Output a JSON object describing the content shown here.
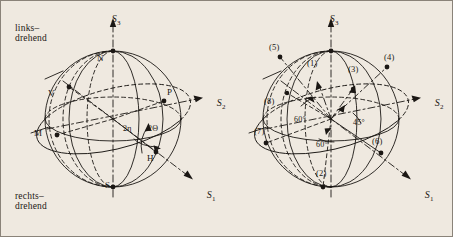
{
  "figure": {
    "kind": "poincare-sphere-pair",
    "background_color": "#efe9e0",
    "ink_color": "#1b1714",
    "border_color": "#8a8379"
  },
  "annotations": {
    "links_drehend": "links–\ndrehend",
    "rechts_drehend": "rechts–\ndrehend"
  },
  "left_sphere": {
    "axes": [
      {
        "name": "S3",
        "base": "S",
        "sub": "3"
      },
      {
        "name": "S2",
        "base": "S",
        "sub": "2"
      },
      {
        "name": "S1",
        "base": "S",
        "sub": "1"
      }
    ],
    "points": [
      {
        "id": "N",
        "label": "N"
      },
      {
        "id": "S",
        "label": "S"
      },
      {
        "id": "V",
        "label": "V"
      },
      {
        "id": "M",
        "label": "M"
      },
      {
        "id": "H",
        "label": "H"
      },
      {
        "id": "P",
        "label": "P"
      }
    ],
    "angles": [
      {
        "id": "two-eta",
        "label": "2η"
      },
      {
        "id": "two-theta",
        "label": "2Θ"
      }
    ]
  },
  "right_sphere": {
    "axes": [
      {
        "name": "S3",
        "base": "S",
        "sub": "3"
      },
      {
        "name": "S2",
        "base": "S",
        "sub": "2"
      },
      {
        "name": "S1",
        "base": "S",
        "sub": "1"
      }
    ],
    "points": [
      {
        "id": "p1",
        "label": "(1)"
      },
      {
        "id": "p2",
        "label": "(2)"
      },
      {
        "id": "p3",
        "label": "(3)"
      },
      {
        "id": "p4",
        "label": "(4)"
      },
      {
        "id": "p5",
        "label": "(5)"
      },
      {
        "id": "p6",
        "label": "(6)"
      },
      {
        "id": "p7",
        "label": "(7)"
      },
      {
        "id": "p8",
        "label": "(8)"
      }
    ],
    "angles": [
      {
        "id": "a60-upper",
        "label": "60°"
      },
      {
        "id": "a60-lower",
        "label": "60°"
      },
      {
        "id": "a45",
        "label": "45°"
      }
    ]
  }
}
